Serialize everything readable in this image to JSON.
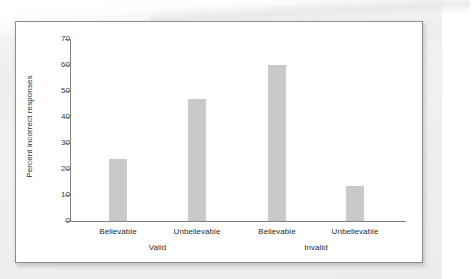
{
  "chart_data": {
    "type": "bar",
    "title": "",
    "xlabel": "",
    "ylabel": "Percent incorrect responses",
    "ylim": [
      0,
      70
    ],
    "yticks": [
      0,
      10,
      20,
      30,
      40,
      50,
      60,
      70
    ],
    "ytick_labels": [
      "0",
      "10",
      "20",
      "30",
      "40",
      "50",
      "60",
      "70"
    ],
    "grid": false,
    "legend": "none",
    "bar_color": "#c9c9c9",
    "axis_color": "#808080",
    "categories": [
      "Believable",
      "Unbelievable",
      "Believable",
      "Unbelievable"
    ],
    "values": [
      24,
      47,
      60,
      13.5
    ],
    "groups": [
      {
        "label": "Valid",
        "categories": [
          "Believable",
          "Unbelievable"
        ],
        "values": [
          24,
          47
        ]
      },
      {
        "label": "Invalid",
        "categories": [
          "Believable",
          "Unbelievable"
        ],
        "values": [
          60,
          13.5
        ]
      }
    ],
    "bars": [
      {
        "category": "Believable",
        "group": "Valid",
        "value": 24
      },
      {
        "category": "Unbelievable",
        "group": "Valid",
        "value": 47
      },
      {
        "category": "Believable",
        "group": "Invalid",
        "value": 60
      },
      {
        "category": "Unbelievable",
        "group": "Invalid",
        "value": 13.5
      }
    ]
  },
  "figure": {
    "panel_background": "#ffffff",
    "panel_border": "#8c8c8c",
    "page_background": "#efefef"
  }
}
